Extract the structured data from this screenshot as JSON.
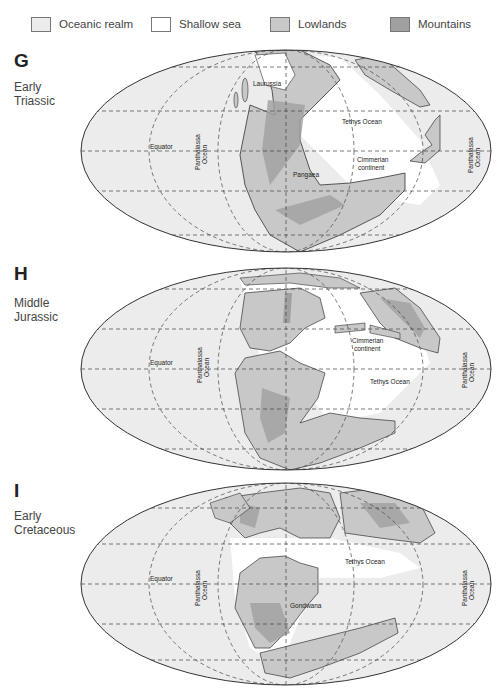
{
  "legend": {
    "items": [
      {
        "label": "Oceanic realm",
        "color": "#ececec"
      },
      {
        "label": "Shallow sea",
        "color": "#ffffff"
      },
      {
        "label": "Lowlands",
        "color": "#c8c8c8"
      },
      {
        "label": "Mountains",
        "color": "#a0a0a0"
      }
    ]
  },
  "panels": [
    {
      "letter": "G",
      "period_line1": "Early",
      "period_line2": "Triassic",
      "labels": {
        "equator": "Equator",
        "panthalassa_left_1": "Panthalassa",
        "panthalassa_left_2": "Ocean",
        "panthalassa_right_1": "Panthalassa",
        "panthalassa_right_2": "Ocean",
        "laurussia": "Laurussia",
        "tethys": "Tethys Ocean",
        "cimmerian_1": "Cimmerian",
        "cimmerian_2": "continent",
        "pangaea": "Pangaea"
      }
    },
    {
      "letter": "H",
      "period_line1": "Middle",
      "period_line2": "Jurassic",
      "labels": {
        "equator": "Equator",
        "panthalassa_left_1": "Panthalassa",
        "panthalassa_left_2": "Ocean",
        "panthalassa_right_1": "Panthalassa",
        "panthalassa_right_2": "Ocean",
        "cimmerian_1": "Cimmerian",
        "cimmerian_2": "continent",
        "tethys": "Tethys Ocean"
      }
    },
    {
      "letter": "I",
      "period_line1": "Early",
      "period_line2": "Cretaceous",
      "labels": {
        "equator": "Equator",
        "panthalassa_left_1": "Panthalassa",
        "panthalassa_left_2": "Ocean",
        "panthalassa_right_1": "Panthalassa",
        "panthalassa_right_2": "Ocean",
        "tethys": "Tethys Ocean",
        "gondwana": "Gondwana"
      }
    }
  ]
}
